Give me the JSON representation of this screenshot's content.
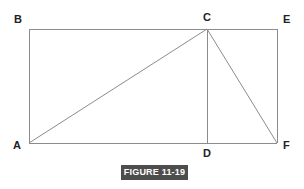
{
  "figure": {
    "caption": "FIGURE 11-19",
    "caption_bar_color": "#4d4d4d",
    "caption_text_color": "#ffffff",
    "background_color": "#ffffff",
    "stroke_color": "#8c8c8c",
    "label_color": "#222222"
  },
  "diagram": {
    "type": "geometry",
    "shape": "rectangle-with-inscribed-triangles",
    "vertices": [
      {
        "id": "B",
        "label": "B",
        "x": 29,
        "y": 29,
        "label_x": 14,
        "label_y": 14
      },
      {
        "id": "C",
        "label": "C",
        "x": 207,
        "y": 29,
        "label_x": 203,
        "label_y": 12
      },
      {
        "id": "E",
        "label": "E",
        "x": 277,
        "y": 29,
        "label_x": 283,
        "label_y": 14
      },
      {
        "id": "A",
        "label": "A",
        "x": 29,
        "y": 143,
        "label_x": 13,
        "label_y": 140
      },
      {
        "id": "D",
        "label": "D",
        "x": 207,
        "y": 143,
        "label_x": 203,
        "label_y": 148
      },
      {
        "id": "F",
        "label": "F",
        "x": 277,
        "y": 143,
        "label_x": 283,
        "label_y": 140
      }
    ],
    "rectangle": {
      "name": "BEFA",
      "left": 29,
      "top": 29,
      "right": 277,
      "bottom": 143
    },
    "segments": [
      {
        "name": "BE",
        "from": "B",
        "to": "E",
        "x1": 29,
        "y1": 29,
        "x2": 277,
        "y2": 29
      },
      {
        "name": "EF",
        "from": "E",
        "to": "F",
        "x1": 277,
        "y1": 29,
        "x2": 277,
        "y2": 143
      },
      {
        "name": "FA",
        "from": "F",
        "to": "A",
        "x1": 277,
        "y1": 143,
        "x2": 29,
        "y2": 143
      },
      {
        "name": "AB",
        "from": "A",
        "to": "B",
        "x1": 29,
        "y1": 143,
        "x2": 29,
        "y2": 29
      },
      {
        "name": "AC",
        "from": "A",
        "to": "C",
        "x1": 29,
        "y1": 143,
        "x2": 207,
        "y2": 29
      },
      {
        "name": "CD",
        "from": "C",
        "to": "D",
        "x1": 207,
        "y1": 29,
        "x2": 207,
        "y2": 143
      },
      {
        "name": "CF",
        "from": "C",
        "to": "F",
        "x1": 207,
        "y1": 29,
        "x2": 277,
        "y2": 143
      }
    ]
  }
}
